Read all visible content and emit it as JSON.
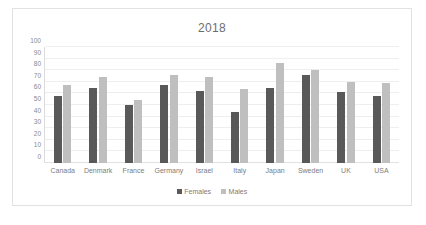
{
  "chart_data": {
    "type": "bar",
    "title": "2018",
    "xlabel": "",
    "ylabel": "",
    "ylim": [
      0,
      100
    ],
    "yticks": [
      100,
      90,
      80,
      70,
      60,
      50,
      40,
      30,
      20,
      10,
      0
    ],
    "grid": true,
    "legend_position": "bottom",
    "categories": [
      "Canada",
      "Denmark",
      "France",
      "Germany",
      "Israel",
      "Italy",
      "Japan",
      "Sweden",
      "UK",
      "USA"
    ],
    "series": [
      {
        "name": "Females",
        "color": "#595959",
        "values": [
          58,
          65,
          50,
          67,
          62,
          44,
          65,
          76,
          61,
          58
        ]
      },
      {
        "name": "Males",
        "color": "#bfbfbf",
        "values": [
          67,
          74,
          54,
          76,
          74,
          64,
          86,
          80,
          70,
          69
        ]
      }
    ]
  }
}
